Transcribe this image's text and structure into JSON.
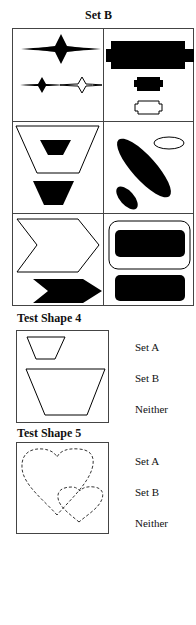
{
  "set_b": {
    "title": "Set B",
    "cells": [
      {
        "position": "row1-left",
        "description": "four-pointed stars: one large black, one small black, one small white"
      },
      {
        "position": "row1-right",
        "description": "notched rectangles: one large black, one small black, one small white"
      },
      {
        "position": "row2-left",
        "description": "inverted trapezoids: one large white containing small black, one medium black"
      },
      {
        "position": "row2-right",
        "description": "ellipses: one large black diagonal, one small black diagonal, one small white horizontal"
      },
      {
        "position": "row3-left",
        "description": "chevron arrows: one large white, one black"
      },
      {
        "position": "row3-right",
        "description": "rounded rectangles: one large white containing black, one black"
      }
    ]
  },
  "test_shape_4": {
    "title": "Test Shape 4",
    "description": "two white inverted trapezoids, small and large",
    "options": [
      "Set A",
      "Set B",
      "Neither"
    ]
  },
  "test_shape_5": {
    "title": "Test Shape 5",
    "description": "two dashed-outline hearts, large and small",
    "options": [
      "Set A",
      "Set B",
      "Neither"
    ]
  }
}
